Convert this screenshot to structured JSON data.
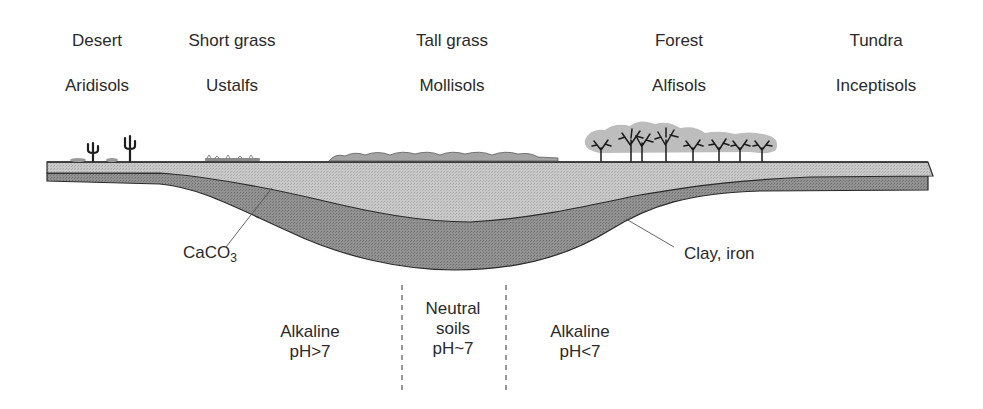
{
  "biomes": [
    {
      "name": "Desert",
      "soil": "Aridisols",
      "x": 97
    },
    {
      "name": "Short grass",
      "soil": "Ustalfs",
      "x": 232
    },
    {
      "name": "Tall grass",
      "soil": "Mollisols",
      "x": 452
    },
    {
      "name": "Forest",
      "soil": "Alfisols",
      "x": 679
    },
    {
      "name": "Tundra",
      "soil": "Inceptisols",
      "x": 876
    }
  ],
  "annotations": {
    "left_label_main": "CaCO",
    "left_label_sub": "3",
    "right_label": "Clay, iron"
  },
  "ph_zones": [
    {
      "line1": "",
      "line2": "Alkaline",
      "line3": "pH>7"
    },
    {
      "line1": "Neutral",
      "line2": "soils",
      "line3": "pH~7"
    },
    {
      "line1": "",
      "line2": "Alkaline",
      "line3": "pH<7"
    }
  ],
  "colors": {
    "topsoil": "#c4c4c4",
    "subsoil": "#8c8c8c",
    "outline": "#2a2a2a",
    "vegetation": "#a9a9a9"
  }
}
